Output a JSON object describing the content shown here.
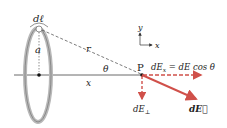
{
  "diagram": {
    "labels": {
      "dl": "dℓ",
      "a": "a",
      "r": "r",
      "x": "x",
      "theta": "θ",
      "P": "P",
      "dEx": "dEx = dE cos θ",
      "dEx_main": "dE",
      "dEx_sub": "x",
      "dEx_rest": " = dE cos θ",
      "dEperp_main": "dE",
      "dEperp_sub": "⊥",
      "dE_vec": "dE⃗",
      "axis_y": "y",
      "axis_x": "x"
    },
    "colors": {
      "ring": "#9a9a9a",
      "arrow": "#d0504a",
      "line": "#333333"
    }
  }
}
